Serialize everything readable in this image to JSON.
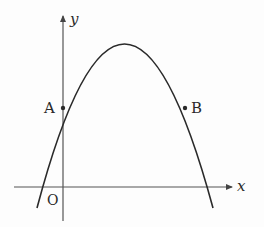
{
  "diagram": {
    "type": "parabola-graph",
    "colors": {
      "curve": "#2a2a2a",
      "axis": "#555555",
      "text": "#2a2a2a"
    },
    "axes": {
      "x_label": "x",
      "y_label": "y",
      "origin_label": "O"
    },
    "points": [
      {
        "label": "A",
        "description": "intersection of parabola with y-axis"
      },
      {
        "label": "B",
        "description": "point on parabola at same height as A"
      }
    ],
    "curve": {
      "shape": "downward-opening parabola",
      "vertex_between": "A and B"
    }
  }
}
